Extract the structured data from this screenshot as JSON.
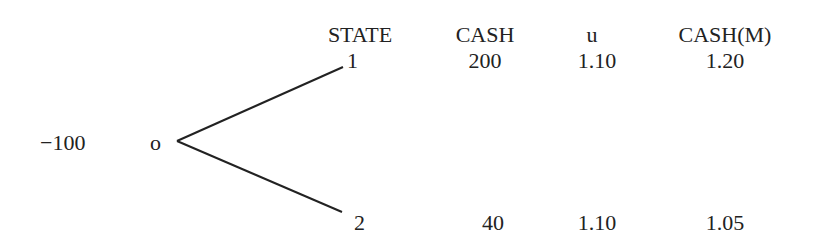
{
  "headers": {
    "state": "STATE",
    "cash": "CASH",
    "u": "u",
    "cash_m": "CASH(M)"
  },
  "root": {
    "value": "−100",
    "node": "o"
  },
  "rows": [
    {
      "state": "1",
      "cash": "200",
      "u": "1.10",
      "cash_m": "1.20"
    },
    {
      "state": "2",
      "cash": "40",
      "u": "1.10",
      "cash_m": "1.05"
    }
  ],
  "colors": {
    "ink": "#222222",
    "background": "#ffffff"
  }
}
